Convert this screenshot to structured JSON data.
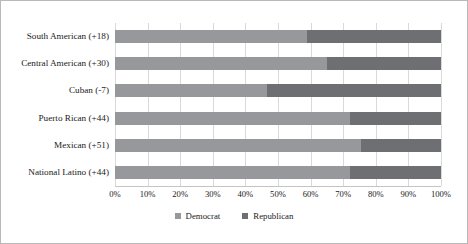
{
  "chart_data": {
    "type": "bar",
    "subtype": "horizontal-stacked-100-percent",
    "title": "",
    "xlabel": "",
    "ylabel": "",
    "xlim": [
      0,
      100
    ],
    "grid": true,
    "legend_position": "bottom-center",
    "categories": [
      "South American (+18)",
      "Central American (+30)",
      "Cuban (-7)",
      "Puerto Rican (+44)",
      "Mexican (+51)",
      "National Latino (+44)"
    ],
    "series": [
      {
        "name": "Democrat",
        "color": "#96989b",
        "values": [
          59,
          65,
          46.5,
          72,
          75.5,
          72
        ]
      },
      {
        "name": "Republican",
        "color": "#6e6f72",
        "values": [
          41,
          35,
          53.5,
          28,
          24.5,
          28
        ]
      }
    ],
    "xtick_labels": [
      "0%",
      "10%",
      "20%",
      "30%",
      "40%",
      "50%",
      "60%",
      "70%",
      "80%",
      "90%",
      "100%"
    ],
    "xtick_values": [
      0,
      10,
      20,
      30,
      40,
      50,
      60,
      70,
      80,
      90,
      100
    ]
  },
  "legend": {
    "items": [
      {
        "label": "Democrat",
        "color": "#96989b"
      },
      {
        "label": "Republican",
        "color": "#6e6f72"
      }
    ]
  }
}
